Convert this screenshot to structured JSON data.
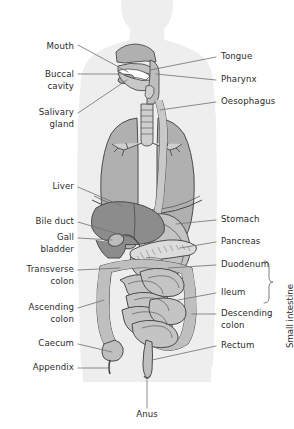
{
  "figure": {
    "kind": "labelled anatomical diagram",
    "background_color": "#ffffff",
    "label_text_color": "#2b2b2b",
    "leader_line_color": "#6e6e6e"
  },
  "colors": {
    "body_silhouette": "#eeeeee",
    "body_silhouette_edge": "#e2e2e2",
    "organ_light": "#c9c9c9",
    "organ_mid": "#b4b4b4",
    "organ_dark": "#8f8f8f",
    "liver_dark": "#8c8c8c",
    "outline": "#4a4a4a",
    "pancreas_fill": "#dcdcdc"
  },
  "labels_left": [
    {
      "id": "mouth",
      "text": "Mouth",
      "lines": [
        "Mouth"
      ],
      "x": 74,
      "y": 47
    },
    {
      "id": "buccal-cavity",
      "text": "Buccal cavity",
      "lines": [
        "Buccal",
        "cavity"
      ],
      "x": 74,
      "y": 75
    },
    {
      "id": "salivary-gland",
      "text": "Salivary gland",
      "lines": [
        "Salivary",
        "gland"
      ],
      "x": 74,
      "y": 113
    },
    {
      "id": "liver",
      "text": "Liver",
      "lines": [
        "Liver"
      ],
      "x": 74,
      "y": 187
    },
    {
      "id": "bile-duct",
      "text": "Bile duct",
      "lines": [
        "Bile duct"
      ],
      "x": 74,
      "y": 222
    },
    {
      "id": "gall-bladder",
      "text": "Gall bladder",
      "lines": [
        "Gall",
        "bladder"
      ],
      "x": 74,
      "y": 240
    },
    {
      "id": "transverse-colon",
      "text": "Transverse colon",
      "lines": [
        "Transverse",
        "colon"
      ],
      "x": 74,
      "y": 272
    },
    {
      "id": "ascending-colon",
      "text": "Ascending colon",
      "lines": [
        "Ascending",
        "colon"
      ],
      "x": 74,
      "y": 310
    },
    {
      "id": "caecum",
      "text": "Caecum",
      "lines": [
        "Caecum"
      ],
      "x": 74,
      "y": 345
    },
    {
      "id": "appendix",
      "text": "Appendix",
      "lines": [
        "Appendix"
      ],
      "x": 74,
      "y": 369
    }
  ],
  "labels_right": [
    {
      "id": "tongue",
      "text": "Tongue",
      "lines": [
        "Tongue"
      ],
      "x": 219,
      "y": 59
    },
    {
      "id": "pharynx",
      "text": "Pharynx",
      "lines": [
        "Pharynx"
      ],
      "x": 219,
      "y": 82
    },
    {
      "id": "oesophagus",
      "text": "Oesophagus",
      "lines": [
        "Oesophagus"
      ],
      "x": 219,
      "y": 104
    },
    {
      "id": "stomach",
      "text": "Stomach",
      "lines": [
        "Stomach"
      ],
      "x": 219,
      "y": 222
    },
    {
      "id": "pancreas",
      "text": "Pancreas",
      "lines": [
        "Pancreas"
      ],
      "x": 219,
      "y": 244
    },
    {
      "id": "duodenum",
      "text": "Duodenum",
      "lines": [
        "Duodenum"
      ],
      "x": 219,
      "y": 267
    },
    {
      "id": "ileum",
      "text": "Ileum",
      "lines": [
        "Ileum"
      ],
      "x": 219,
      "y": 295
    },
    {
      "id": "descending-colon",
      "text": "Descending colon",
      "lines": [
        "Descending",
        "colon"
      ],
      "x": 219,
      "y": 316
    },
    {
      "id": "rectum",
      "text": "Rectum",
      "lines": [
        "Rectum"
      ],
      "x": 219,
      "y": 348
    }
  ],
  "labels_bottom": [
    {
      "id": "anus",
      "text": "Anus",
      "lines": [
        "Anus"
      ],
      "x": 147,
      "y": 415
    }
  ],
  "bracket_label": {
    "id": "small-intestine",
    "text": "Small intestine",
    "orientation": "vertical-bottom-to-top",
    "x": 285,
    "y": 348,
    "bracket": {
      "x": 268,
      "top": 261,
      "bottom": 302
    }
  },
  "organ_names": [
    "Mouth",
    "Buccal cavity",
    "Salivary gland",
    "Tongue",
    "Pharynx",
    "Oesophagus",
    "Liver",
    "Stomach",
    "Pancreas",
    "Bile duct",
    "Gall bladder",
    "Duodenum",
    "Transverse colon",
    "Ascending colon",
    "Descending colon",
    "Ileum",
    "Caecum",
    "Appendix",
    "Rectum",
    "Anus",
    "Small intestine"
  ]
}
